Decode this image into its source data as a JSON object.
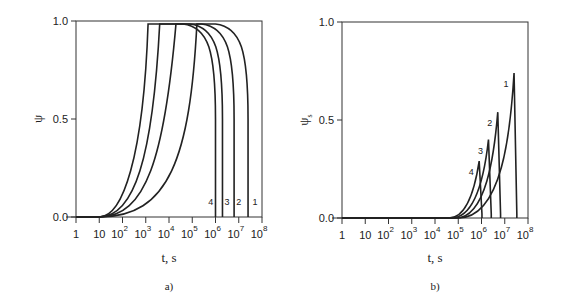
{
  "chart_data": [
    {
      "type": "line",
      "panel_label": "a)",
      "xlabel": "t, s",
      "ylabel": "ψ",
      "xscale": "log",
      "xlim": [
        1,
        100000000
      ],
      "ylim": [
        0,
        1
      ],
      "x_ticks": [
        {
          "base": "1",
          "exp": ""
        },
        {
          "base": "10",
          "exp": ""
        },
        {
          "base": "10",
          "exp": "2"
        },
        {
          "base": "10",
          "exp": "3"
        },
        {
          "base": "10",
          "exp": "4"
        },
        {
          "base": "10",
          "exp": "5"
        },
        {
          "base": "10",
          "exp": "6"
        },
        {
          "base": "10",
          "exp": "7"
        },
        {
          "base": "10",
          "exp": "8"
        }
      ],
      "y_ticks": [
        "0.0",
        "0.5",
        "1.0"
      ],
      "grid": false,
      "series": [
        {
          "name": "1",
          "rise_log10t": [
            1.0,
            4.0,
            4.9,
            5.2
          ],
          "fall_log10t": 7.4,
          "label_pos_log10t": 7.7
        },
        {
          "name": "2",
          "rise_log10t": [
            1.0,
            3.0,
            3.8,
            4.3
          ],
          "fall_log10t": 6.8,
          "label_pos_log10t": 7.0
        },
        {
          "name": "3",
          "rise_log10t": [
            1.0,
            2.5,
            3.3,
            3.6
          ],
          "fall_log10t": 6.3,
          "label_pos_log10t": 6.5
        },
        {
          "name": "4",
          "rise_log10t": [
            1.0,
            2.0,
            2.9,
            3.1
          ],
          "fall_log10t": 6.0,
          "label_pos_log10t": 5.8
        }
      ]
    },
    {
      "type": "line",
      "panel_label": "b)",
      "xlabel": "t, s",
      "ylabel": "ψ",
      "ylabel_sub": "s",
      "xscale": "log",
      "xlim": [
        1,
        100000000
      ],
      "ylim": [
        0,
        1
      ],
      "x_ticks": [
        {
          "base": "1",
          "exp": ""
        },
        {
          "base": "10",
          "exp": ""
        },
        {
          "base": "10",
          "exp": "2"
        },
        {
          "base": "10",
          "exp": "3"
        },
        {
          "base": "10",
          "exp": "4"
        },
        {
          "base": "10",
          "exp": "5"
        },
        {
          "base": "10",
          "exp": "6"
        },
        {
          "base": "10",
          "exp": "7"
        },
        {
          "base": "10",
          "exp": "8"
        }
      ],
      "y_ticks": [
        "0.0",
        "0.5",
        "1.0"
      ],
      "grid": false,
      "series": [
        {
          "name": "1",
          "onset_log10t": 5.0,
          "peak_log10t": 7.4,
          "peak_value": 0.74
        },
        {
          "name": "2",
          "onset_log10t": 4.9,
          "peak_log10t": 6.7,
          "peak_value": 0.54
        },
        {
          "name": "3",
          "onset_log10t": 4.7,
          "peak_log10t": 6.3,
          "peak_value": 0.4
        },
        {
          "name": "4",
          "onset_log10t": 4.6,
          "peak_log10t": 5.9,
          "peak_value": 0.29
        }
      ]
    }
  ]
}
